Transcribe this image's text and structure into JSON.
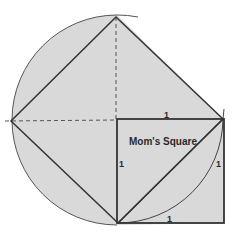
{
  "diagram": {
    "title_label": "Mom's Square",
    "side_labels": {
      "top": "1",
      "left": "1",
      "right": "1",
      "bottom": "1"
    },
    "colors": {
      "fill": "#d9d9d9",
      "stroke": "#333333",
      "dash": "#555555",
      "background": "#ffffff"
    },
    "geometry": {
      "circle_center": [
        117,
        120
      ],
      "circle_radius": 105,
      "tilted_square_vertices": [
        [
          116,
          17
        ],
        [
          11,
          121
        ],
        [
          118,
          223
        ],
        [
          223,
          119
        ]
      ],
      "mom_square": {
        "x": 117,
        "y": 119,
        "size": 106
      }
    }
  }
}
